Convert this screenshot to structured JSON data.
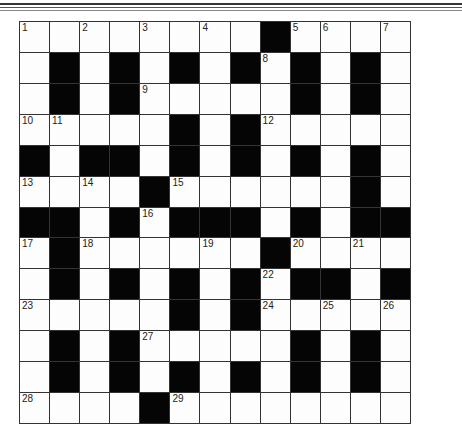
{
  "puzzle": {
    "type": "crossword",
    "rows": 13,
    "cols": 13,
    "black_cells": [
      [
        0,
        8
      ],
      [
        1,
        1
      ],
      [
        1,
        3
      ],
      [
        1,
        5
      ],
      [
        1,
        7
      ],
      [
        1,
        9
      ],
      [
        1,
        11
      ],
      [
        2,
        1
      ],
      [
        2,
        3
      ],
      [
        2,
        9
      ],
      [
        2,
        11
      ],
      [
        3,
        5
      ],
      [
        3,
        7
      ],
      [
        4,
        0
      ],
      [
        4,
        2
      ],
      [
        4,
        3
      ],
      [
        4,
        5
      ],
      [
        4,
        7
      ],
      [
        4,
        9
      ],
      [
        4,
        11
      ],
      [
        5,
        4
      ],
      [
        5,
        11
      ],
      [
        6,
        0
      ],
      [
        6,
        1
      ],
      [
        6,
        3
      ],
      [
        6,
        5
      ],
      [
        6,
        6
      ],
      [
        6,
        7
      ],
      [
        6,
        9
      ],
      [
        6,
        11
      ],
      [
        6,
        12
      ],
      [
        7,
        1
      ],
      [
        7,
        8
      ],
      [
        8,
        1
      ],
      [
        8,
        3
      ],
      [
        8,
        5
      ],
      [
        8,
        7
      ],
      [
        8,
        9
      ],
      [
        8,
        10
      ],
      [
        8,
        12
      ],
      [
        9,
        5
      ],
      [
        9,
        7
      ],
      [
        10,
        1
      ],
      [
        10,
        3
      ],
      [
        10,
        9
      ],
      [
        10,
        11
      ],
      [
        11,
        1
      ],
      [
        11,
        3
      ],
      [
        11,
        5
      ],
      [
        11,
        7
      ],
      [
        11,
        9
      ],
      [
        11,
        11
      ],
      [
        12,
        4
      ]
    ],
    "numbers": [
      {
        "n": "1",
        "r": 0,
        "c": 0
      },
      {
        "n": "2",
        "r": 0,
        "c": 2
      },
      {
        "n": "3",
        "r": 0,
        "c": 4
      },
      {
        "n": "4",
        "r": 0,
        "c": 6
      },
      {
        "n": "5",
        "r": 0,
        "c": 9
      },
      {
        "n": "6",
        "r": 0,
        "c": 10
      },
      {
        "n": "7",
        "r": 0,
        "c": 12
      },
      {
        "n": "8",
        "r": 1,
        "c": 8
      },
      {
        "n": "9",
        "r": 2,
        "c": 4
      },
      {
        "n": "10",
        "r": 3,
        "c": 0
      },
      {
        "n": "11",
        "r": 3,
        "c": 1
      },
      {
        "n": "12",
        "r": 3,
        "c": 8
      },
      {
        "n": "13",
        "r": 5,
        "c": 0
      },
      {
        "n": "14",
        "r": 5,
        "c": 2
      },
      {
        "n": "15",
        "r": 5,
        "c": 5
      },
      {
        "n": "16",
        "r": 6,
        "c": 4
      },
      {
        "n": "17",
        "r": 7,
        "c": 0
      },
      {
        "n": "18",
        "r": 7,
        "c": 2
      },
      {
        "n": "19",
        "r": 7,
        "c": 6
      },
      {
        "n": "20",
        "r": 7,
        "c": 9
      },
      {
        "n": "21",
        "r": 7,
        "c": 11
      },
      {
        "n": "22",
        "r": 8,
        "c": 8
      },
      {
        "n": "23",
        "r": 9,
        "c": 0
      },
      {
        "n": "24",
        "r": 9,
        "c": 8
      },
      {
        "n": "25",
        "r": 9,
        "c": 10
      },
      {
        "n": "26",
        "r": 9,
        "c": 12
      },
      {
        "n": "27",
        "r": 10,
        "c": 4
      },
      {
        "n": "28",
        "r": 12,
        "c": 0
      },
      {
        "n": "29",
        "r": 12,
        "c": 5
      }
    ],
    "colors": {
      "black": "#050505",
      "white": "#fdfdfd",
      "line": "#333333"
    }
  }
}
